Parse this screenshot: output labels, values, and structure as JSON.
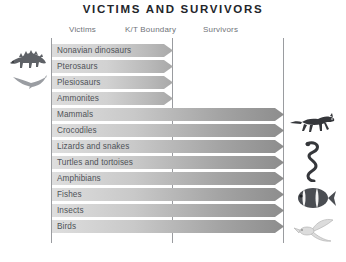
{
  "title": "VICTIMS AND SURVIVORS",
  "headers": {
    "victims": "Victims",
    "boundary": "K/T Boundary",
    "survivors": "Survivors"
  },
  "colors": {
    "title": "#23252a",
    "header_text": "#6f7378",
    "row_label": "#4e5257",
    "axis_line": "#9a9ca0",
    "arrow_light": "#dcdcdc",
    "arrow_dark": "#8d8d8d",
    "background": "#ffffff"
  },
  "illustrations": {
    "left": [
      {
        "name": "ankylosaur-illustration",
        "label": "Ankylosaur"
      },
      {
        "name": "pterosaur-illustration",
        "label": "Pterosaur"
      }
    ],
    "right": [
      {
        "name": "mammal-illustration",
        "label": "Running mammal"
      },
      {
        "name": "snake-illustration",
        "label": "Snake"
      },
      {
        "name": "clownfish-illustration",
        "label": "Clownfish"
      },
      {
        "name": "bird-illustration",
        "label": "Bird"
      }
    ]
  },
  "chart_data": {
    "type": "bar",
    "title": "VICTIMS AND SURVIVORS",
    "xlabel": "",
    "ylabel": "",
    "orientation": "horizontal",
    "axis_markers": [
      "Victims",
      "K/T Boundary",
      "Survivors"
    ],
    "boundary_position": 0.52,
    "grid": false,
    "legend": "none",
    "categories": [
      "Nonavian dinosaurs",
      "Pterosaurs",
      "Plesiosaurs",
      "Ammonites",
      "Mammals",
      "Crocodiles",
      "Lizards and snakes",
      "Turtles and tortoises",
      "Amphibians",
      "Fishes",
      "Insects",
      "Birds"
    ],
    "values": [
      0.52,
      0.52,
      0.52,
      0.52,
      1.0,
      1.0,
      1.0,
      1.0,
      1.0,
      1.0,
      1.0,
      1.0
    ],
    "outcome": [
      "victim",
      "victim",
      "victim",
      "victim",
      "survivor",
      "survivor",
      "survivor",
      "survivor",
      "survivor",
      "survivor",
      "survivor",
      "survivor"
    ],
    "rows": [
      {
        "label": "Nonavian dinosaurs",
        "outcome": "victim",
        "extent": 0.52
      },
      {
        "label": "Pterosaurs",
        "outcome": "victim",
        "extent": 0.52
      },
      {
        "label": "Plesiosaurs",
        "outcome": "victim",
        "extent": 0.52
      },
      {
        "label": "Ammonites",
        "outcome": "victim",
        "extent": 0.52
      },
      {
        "label": "Mammals",
        "outcome": "survivor",
        "extent": 1.0
      },
      {
        "label": "Crocodiles",
        "outcome": "survivor",
        "extent": 1.0
      },
      {
        "label": "Lizards and snakes",
        "outcome": "survivor",
        "extent": 1.0
      },
      {
        "label": "Turtles and tortoises",
        "outcome": "survivor",
        "extent": 1.0
      },
      {
        "label": "Amphibians",
        "outcome": "survivor",
        "extent": 1.0
      },
      {
        "label": "Fishes",
        "outcome": "survivor",
        "extent": 1.0
      },
      {
        "label": "Insects",
        "outcome": "survivor",
        "extent": 1.0
      },
      {
        "label": "Birds",
        "outcome": "survivor",
        "extent": 1.0
      }
    ]
  }
}
